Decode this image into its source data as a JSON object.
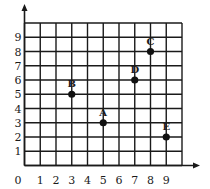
{
  "chart_data": {
    "type": "scatter",
    "title": "",
    "xlabel": "",
    "ylabel": "",
    "xlim": [
      0,
      10
    ],
    "ylim": [
      0,
      10
    ],
    "grid": true,
    "x_ticks": [
      "0",
      "1",
      "2",
      "3",
      "4",
      "5",
      "6",
      "7",
      "8",
      "9"
    ],
    "y_ticks": [
      "1",
      "2",
      "3",
      "4",
      "5",
      "6",
      "7",
      "8",
      "9"
    ],
    "points": [
      {
        "label": "A",
        "x": 5,
        "y": 3
      },
      {
        "label": "B",
        "x": 3,
        "y": 5
      },
      {
        "label": "C",
        "x": 8,
        "y": 8
      },
      {
        "label": "D",
        "x": 7,
        "y": 6
      },
      {
        "label": "E",
        "x": 9,
        "y": 2
      }
    ]
  },
  "colors": {
    "grid": "#1a1a1a",
    "point": "#111111",
    "background": "#ffffff"
  }
}
